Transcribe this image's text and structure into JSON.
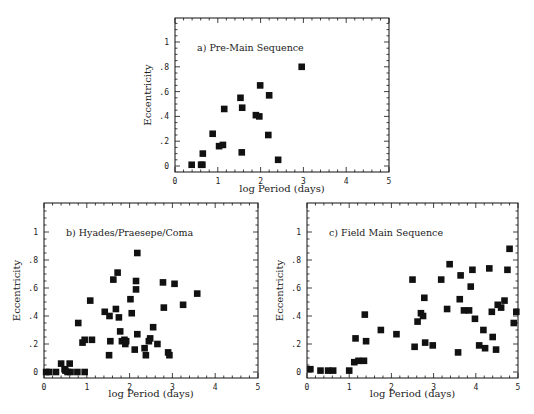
{
  "chart_data": [
    {
      "type": "scatter",
      "panel": "a",
      "title": "a)  Pre-Main Sequence",
      "xlabel": "log Period (days)",
      "ylabel": "Eccentricity",
      "xlim": [
        0,
        5
      ],
      "ylim": [
        -0.05,
        1.2
      ],
      "xticks": [
        "0",
        "1",
        "2",
        "3",
        "4",
        "5"
      ],
      "yticks": [
        "0",
        ".2",
        ".4",
        ".6",
        ".8",
        "1"
      ],
      "grid": false,
      "x": [
        0.39,
        0.61,
        0.64,
        0.65,
        0.88,
        1.03,
        1.12,
        1.15,
        1.53,
        1.57,
        1.56,
        1.89,
        1.97,
        1.99,
        2.2,
        2.18,
        2.41,
        2.96
      ],
      "y": [
        0.01,
        0.01,
        0.01,
        0.1,
        0.26,
        0.16,
        0.17,
        0.46,
        0.55,
        0.47,
        0.11,
        0.41,
        0.4,
        0.65,
        0.57,
        0.25,
        0.05,
        0.8
      ]
    },
    {
      "type": "scatter",
      "panel": "b",
      "title": "b)  Hyades/Praesepe/Coma",
      "xlabel": "log Period (days)",
      "ylabel": "Eccentricity",
      "xlim": [
        0,
        5
      ],
      "ylim": [
        -0.05,
        1.2
      ],
      "xticks": [
        "0",
        "1",
        "2",
        "3",
        "4",
        "5"
      ],
      "yticks": [
        "0",
        ".2",
        ".4",
        ".6",
        ".8",
        "1"
      ],
      "grid": false,
      "x": [
        0.05,
        0.12,
        0.28,
        0.4,
        0.48,
        0.5,
        0.55,
        0.6,
        0.62,
        0.78,
        0.8,
        0.9,
        0.95,
        0.95,
        1.08,
        1.12,
        1.42,
        1.52,
        1.53,
        1.55,
        1.62,
        1.68,
        1.72,
        1.75,
        1.78,
        1.82,
        1.88,
        1.9,
        1.92,
        2.02,
        2.05,
        2.12,
        2.15,
        2.15,
        2.18,
        2.18,
        2.35,
        2.38,
        2.45,
        2.48,
        2.55,
        2.65,
        2.78,
        2.8,
        2.9,
        2.93,
        3.05,
        3.25,
        3.58
      ],
      "y": [
        0.0,
        0.0,
        0.0,
        0.06,
        0.02,
        0.01,
        0.0,
        0.06,
        0.0,
        0.0,
        0.35,
        0.21,
        0.23,
        0.0,
        0.51,
        0.23,
        0.43,
        0.12,
        0.4,
        0.22,
        0.66,
        0.45,
        0.71,
        0.39,
        0.29,
        0.22,
        0.23,
        0.2,
        0.22,
        0.52,
        0.42,
        0.16,
        0.65,
        0.59,
        0.85,
        0.27,
        0.17,
        0.12,
        0.22,
        0.24,
        0.32,
        0.2,
        0.64,
        0.46,
        0.14,
        0.12,
        0.63,
        0.48,
        0.56
      ]
    },
    {
      "type": "scatter",
      "panel": "c",
      "title": "c)  Field Main Sequence",
      "xlabel": "log Period (days)",
      "ylabel": "Eccentricity",
      "xlim": [
        0,
        5
      ],
      "ylim": [
        -0.05,
        1.2
      ],
      "xticks": [
        "0",
        "1",
        "2",
        "3",
        "4",
        "5"
      ],
      "yticks": [
        "0",
        ".2",
        ".4",
        ".6",
        ".8",
        "1"
      ],
      "grid": false,
      "x": [
        0.08,
        0.32,
        0.5,
        0.62,
        1.0,
        1.12,
        1.15,
        1.22,
        1.35,
        1.37,
        1.4,
        1.75,
        2.12,
        2.5,
        2.55,
        2.62,
        2.7,
        2.75,
        2.78,
        2.8,
        2.98,
        3.18,
        3.32,
        3.38,
        3.58,
        3.62,
        3.64,
        3.72,
        3.84,
        3.88,
        3.92,
        3.98,
        4.08,
        4.18,
        4.22,
        4.32,
        4.38,
        4.4,
        4.48,
        4.52,
        4.6,
        4.68,
        4.75,
        4.8,
        4.9,
        4.96
      ],
      "y": [
        0.02,
        0.01,
        0.01,
        0.01,
        0.01,
        0.07,
        0.24,
        0.08,
        0.08,
        0.41,
        0.22,
        0.3,
        0.27,
        0.66,
        0.18,
        0.36,
        0.42,
        0.4,
        0.53,
        0.21,
        0.19,
        0.66,
        0.45,
        0.77,
        0.14,
        0.52,
        0.69,
        0.44,
        0.44,
        0.61,
        0.73,
        0.38,
        0.19,
        0.3,
        0.17,
        0.74,
        0.43,
        0.25,
        0.16,
        0.48,
        0.46,
        0.51,
        0.73,
        0.88,
        0.35,
        0.43
      ]
    }
  ],
  "panels": {
    "a": {
      "title": "a)  Pre-Main Sequence",
      "xlabel": "log Period (days)",
      "ylabel": "Eccentricity"
    },
    "b": {
      "title": "b)  Hyades/Praesepe/Coma",
      "xlabel": "log Period (days)",
      "ylabel": "Eccentricity"
    },
    "c": {
      "title": "c)  Field Main Sequence",
      "xlabel": "log Period (days)",
      "ylabel": "Eccentricity"
    }
  }
}
